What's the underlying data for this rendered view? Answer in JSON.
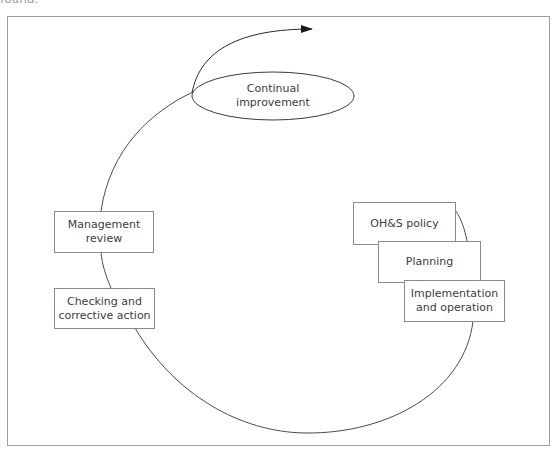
{
  "caption_fragment": "found.",
  "diagram": {
    "center_node": {
      "label_line1": "Continual",
      "label_line2": "improvement"
    },
    "nodes": [
      {
        "id": "ohs-policy",
        "line1": "OH&S policy",
        "line2": ""
      },
      {
        "id": "planning",
        "line1": "Planning",
        "line2": ""
      },
      {
        "id": "implementation",
        "line1": "Implementation",
        "line2": "and operation"
      },
      {
        "id": "checking",
        "line1": "Checking and",
        "line2": "corrective action"
      },
      {
        "id": "management-review",
        "line1": "Management",
        "line2": "review"
      }
    ],
    "colors": {
      "line": "#4a4a4a",
      "frame": "#9d9d9d",
      "box_border": "#8a8a8a"
    }
  }
}
